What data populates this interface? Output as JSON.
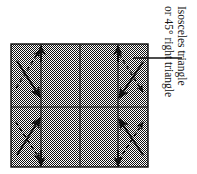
{
  "figure": {
    "callout": {
      "line_1": "Isosceles triangle",
      "line_2": "or 45° right triangle",
      "leader_label": "leader-line"
    },
    "colors": {
      "ink": "#111111",
      "shading": "#a8a8a8",
      "page_background": "#ffffff",
      "grid_line": "#1a1a1a"
    },
    "panel": {
      "x": 11,
      "y": 44,
      "width": 137,
      "height": 123,
      "columns": 4,
      "rows": 2,
      "shading_label": "50% checkerboard dither"
    },
    "grid": {
      "vertical_lines": [
        41,
        80,
        118
      ],
      "horizontal_lines": [
        107
      ]
    },
    "markers": [
      {
        "cell": "top-left",
        "solid_arrow": "diagonal down-right",
        "dashed_arrow": "diagonal up-right",
        "vertical_arrow": "up"
      },
      {
        "cell": "top-right",
        "solid_arrow": "diagonal down-left",
        "dashed_arrow": "diagonal down-right",
        "vertical_arrow": "up"
      },
      {
        "cell": "bottom-left",
        "solid_arrow": "diagonal up-right",
        "dashed_arrow": "diagonal down-right",
        "vertical_arrow": "down"
      },
      {
        "cell": "bottom-right",
        "solid_arrow": "diagonal up-left",
        "dashed_arrow": "diagonal up-right",
        "vertical_arrow": "down"
      }
    ],
    "leader": {
      "x1": 133,
      "y1": 58,
      "x2": 182,
      "y2": 58
    }
  }
}
